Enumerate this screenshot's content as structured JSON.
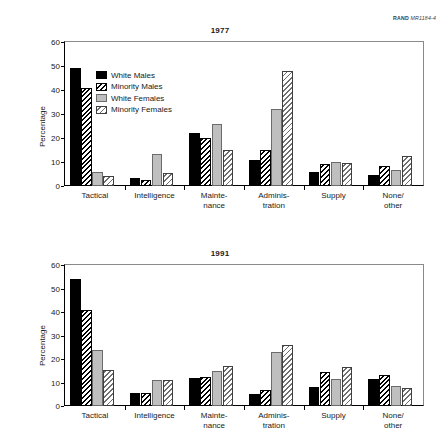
{
  "credit": {
    "brand": "RAND",
    "code": "MR1184-4"
  },
  "axis": {
    "ylabel": "Percentage",
    "yticks": [
      "0",
      "10",
      "20",
      "30",
      "40",
      "50",
      "60"
    ]
  },
  "legend": [
    {
      "label": "White Males",
      "pattern": "solid-black"
    },
    {
      "label": "Minority Males",
      "pattern": "hatch-black"
    },
    {
      "label": "White Females",
      "pattern": "solid-gray"
    },
    {
      "label": "Minority Females",
      "pattern": "hatch-gray"
    }
  ],
  "categories": [
    "Tactical",
    "Intelligence",
    "Mainte-\nnance",
    "Adminis-\ntration",
    "Supply",
    "None/\nother"
  ],
  "panels": [
    {
      "title": "1977"
    },
    {
      "title": "1991"
    }
  ],
  "chart_data": [
    {
      "type": "bar",
      "title": "1977",
      "xlabel": "",
      "ylabel": "Percentage",
      "ylim": [
        0,
        60
      ],
      "ytick_step": 10,
      "grid": false,
      "legend_position": "inside-top-left",
      "categories": [
        "Tactical",
        "Intelligence",
        "Maintenance",
        "Administration",
        "Supply",
        "None/other"
      ],
      "series": [
        {
          "name": "White Males",
          "values": [
            49,
            3.5,
            22,
            11,
            6,
            4.5
          ]
        },
        {
          "name": "Minority Males",
          "values": [
            41,
            2.5,
            20,
            15,
            9,
            8.5
          ]
        },
        {
          "name": "White Females",
          "values": [
            6,
            13.5,
            26,
            32,
            10,
            6.5
          ]
        },
        {
          "name": "Minority Females",
          "values": [
            4,
            5.5,
            15,
            48,
            9.5,
            12.5
          ]
        }
      ]
    },
    {
      "type": "bar",
      "title": "1991",
      "xlabel": "",
      "ylabel": "Percentage",
      "ylim": [
        0,
        60
      ],
      "ytick_step": 10,
      "grid": false,
      "legend_position": "none",
      "categories": [
        "Tactical",
        "Intelligence",
        "Maintenance",
        "Administration",
        "Supply",
        "None/other"
      ],
      "series": [
        {
          "name": "White Males",
          "values": [
            54,
            5.5,
            12,
            5,
            8,
            11.5
          ]
        },
        {
          "name": "Minority Males",
          "values": [
            41,
            5.5,
            12.5,
            7,
            14.5,
            13
          ]
        },
        {
          "name": "White Females",
          "values": [
            24,
            11,
            15,
            23,
            11.5,
            8.5
          ]
        },
        {
          "name": "Minority Females",
          "values": [
            15.5,
            11,
            17,
            26,
            16.5,
            7.5
          ]
        }
      ]
    }
  ]
}
